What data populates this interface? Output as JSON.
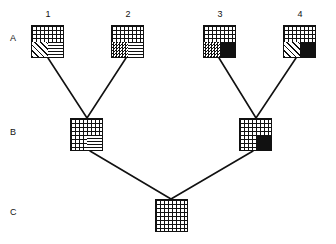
{
  "diagram": {
    "title": "",
    "colors": {
      "ink": "#111111",
      "paper": "#ffffff"
    },
    "row_labels": [
      {
        "id": "A",
        "text": "A",
        "y": 38
      },
      {
        "id": "B",
        "text": "B",
        "y": 132
      },
      {
        "id": "C",
        "text": "C",
        "y": 212
      }
    ],
    "taxon_labels": [
      {
        "id": "1",
        "text": "1",
        "x": 42,
        "y": 12
      },
      {
        "id": "2",
        "text": "2",
        "x": 122,
        "y": 12
      },
      {
        "id": "3",
        "text": "3",
        "x": 212,
        "y": 12
      },
      {
        "id": "4",
        "text": "4",
        "x": 292,
        "y": 12
      }
    ],
    "nodes": [
      {
        "id": "A1",
        "row": "A",
        "label": "1",
        "x": 31,
        "y": 25,
        "w": 33,
        "h": 33,
        "quadrants": {
          "top_left": "grid",
          "top_right": "grid",
          "bottom_left": "diagonal-hatch",
          "bottom_right": "horizontal-lines"
        }
      },
      {
        "id": "A2",
        "row": "A",
        "label": "2",
        "x": 111,
        "y": 25,
        "w": 33,
        "h": 33,
        "quadrants": {
          "top_left": "grid",
          "top_right": "grid",
          "bottom_left": "checkerboard",
          "bottom_right": "horizontal-lines"
        }
      },
      {
        "id": "A3",
        "row": "A",
        "label": "3",
        "x": 203,
        "y": 25,
        "w": 33,
        "h": 33,
        "quadrants": {
          "top_left": "grid",
          "top_right": "grid",
          "bottom_left": "checkerboard",
          "bottom_right": "solid-black"
        }
      },
      {
        "id": "A4",
        "row": "A",
        "label": "4",
        "x": 283,
        "y": 25,
        "w": 33,
        "h": 33,
        "quadrants": {
          "top_left": "grid",
          "top_right": "grid",
          "bottom_left": "diagonal-hatch",
          "bottom_right": "solid-black"
        }
      },
      {
        "id": "B1",
        "row": "B",
        "label": "",
        "x": 70,
        "y": 118,
        "w": 33,
        "h": 33,
        "quadrants": {
          "top_left": "grid",
          "top_right": "grid",
          "bottom_left": "grid",
          "bottom_right": "horizontal-lines"
        }
      },
      {
        "id": "B2",
        "row": "B",
        "label": "",
        "x": 239,
        "y": 118,
        "w": 33,
        "h": 33,
        "quadrants": {
          "top_left": "grid",
          "top_right": "grid",
          "bottom_left": "grid",
          "bottom_right": "solid-black"
        }
      },
      {
        "id": "C1",
        "row": "C",
        "label": "",
        "x": 155,
        "y": 199,
        "w": 33,
        "h": 33,
        "quadrants": {
          "top_left": "grid",
          "top_right": "grid",
          "bottom_left": "grid",
          "bottom_right": "grid"
        }
      }
    ],
    "edges": [
      {
        "id": "edge-B1-A1",
        "from": "B1",
        "to": "A1",
        "x1": 87,
        "y1": 118,
        "x2": 48,
        "y2": 58
      },
      {
        "id": "edge-B1-A2",
        "from": "B1",
        "to": "A2",
        "x1": 87,
        "y1": 118,
        "x2": 126,
        "y2": 58
      },
      {
        "id": "edge-B2-A3",
        "from": "B2",
        "to": "A3",
        "x1": 256,
        "y1": 118,
        "x2": 219,
        "y2": 58
      },
      {
        "id": "edge-B2-A4",
        "from": "B2",
        "to": "A4",
        "x1": 256,
        "y1": 118,
        "x2": 296,
        "y2": 58
      },
      {
        "id": "edge-C1-B1",
        "from": "C1",
        "to": "B1",
        "x1": 171,
        "y1": 199,
        "x2": 90,
        "y2": 151
      },
      {
        "id": "edge-C1-B2",
        "from": "C1",
        "to": "B2",
        "x1": 171,
        "y1": 199,
        "x2": 253,
        "y2": 151
      }
    ]
  }
}
